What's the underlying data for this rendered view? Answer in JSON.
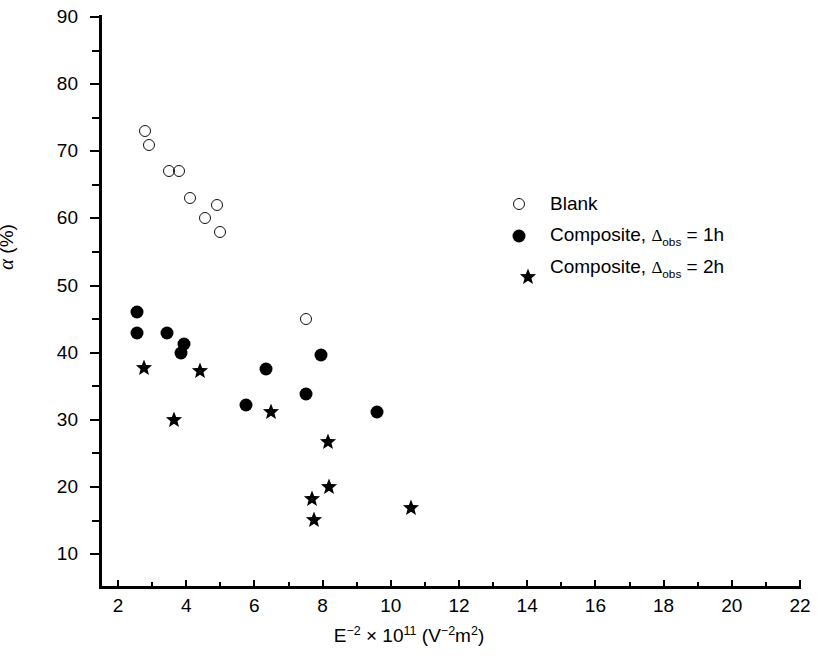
{
  "chart_data": {
    "type": "scatter",
    "title": "",
    "xlabel": "E−2 × 1011 (V−2m2)",
    "ylabel": "α (%)",
    "xlim": [
      0.6,
      22.5
    ],
    "ylim": [
      5,
      90
    ],
    "x_ticks": [
      2,
      4,
      6,
      8,
      10,
      12,
      14,
      16,
      18,
      20,
      22
    ],
    "y_ticks": [
      10,
      20,
      30,
      40,
      50,
      60,
      70,
      80,
      90
    ],
    "x_minor_ticks": [
      3,
      5,
      7,
      9,
      11,
      13,
      15,
      17,
      19,
      21
    ],
    "y_minor_ticks": [
      15,
      25,
      35,
      45,
      55,
      65,
      75,
      85
    ],
    "grid": false,
    "legend_position": "right",
    "series": [
      {
        "name": "Blank",
        "marker": "open-circle",
        "color": "#111111",
        "points": [
          {
            "x": 2.8,
            "y": 73.0
          },
          {
            "x": 2.9,
            "y": 71.0
          },
          {
            "x": 3.5,
            "y": 67.0
          },
          {
            "x": 3.8,
            "y": 67.0
          },
          {
            "x": 4.1,
            "y": 63.0
          },
          {
            "x": 4.55,
            "y": 60.0
          },
          {
            "x": 4.9,
            "y": 62.0
          },
          {
            "x": 5.0,
            "y": 58.0
          },
          {
            "x": 7.5,
            "y": 45.0
          }
        ]
      },
      {
        "name": "Composite, Δobs = 1h",
        "marker": "filled-circle",
        "color": "#000000",
        "points": [
          {
            "x": 2.55,
            "y": 46.0
          },
          {
            "x": 2.55,
            "y": 43.0
          },
          {
            "x": 3.45,
            "y": 43.0
          },
          {
            "x": 3.95,
            "y": 41.3
          },
          {
            "x": 3.85,
            "y": 40.0
          },
          {
            "x": 5.75,
            "y": 32.2
          },
          {
            "x": 6.35,
            "y": 37.6
          },
          {
            "x": 7.5,
            "y": 33.9
          },
          {
            "x": 7.95,
            "y": 39.6
          },
          {
            "x": 9.6,
            "y": 31.2
          }
        ]
      },
      {
        "name": "Composite, Δobs = 2h",
        "marker": "star",
        "color": "#000000",
        "points": [
          {
            "x": 2.5,
            "y": 39.0
          },
          {
            "x": 3.4,
            "y": 31.3
          },
          {
            "x": 4.15,
            "y": 38.5
          },
          {
            "x": 6.25,
            "y": 32.4
          },
          {
            "x": 7.9,
            "y": 28.0
          },
          {
            "x": 7.45,
            "y": 19.5
          },
          {
            "x": 7.95,
            "y": 21.2
          },
          {
            "x": 7.5,
            "y": 16.4
          },
          {
            "x": 10.35,
            "y": 18.2
          }
        ]
      }
    ]
  },
  "legend": {
    "items": [
      {
        "symbol": "open-circle",
        "label_prefix": "Blank",
        "delta": "",
        "suffix": ""
      },
      {
        "symbol": "filled-circle",
        "label_prefix": "Composite, ",
        "delta": "Δ",
        "sub": "obs",
        "suffix": " = 1h"
      },
      {
        "symbol": "star",
        "label_prefix": "Composite, ",
        "delta": "Δ",
        "sub": "obs",
        "suffix": " = 2h"
      }
    ]
  },
  "axis_titles": {
    "y_symbol": "α",
    "y_unit": " (%)",
    "x_base": "E",
    "x_exp1": "−2",
    "x_mult": " × 10",
    "x_exp2": "11",
    "x_units_open": " (V",
    "x_units_exp": "−2",
    "x_units_m": "m",
    "x_units_m_exp": "2",
    "x_units_close": ")"
  }
}
